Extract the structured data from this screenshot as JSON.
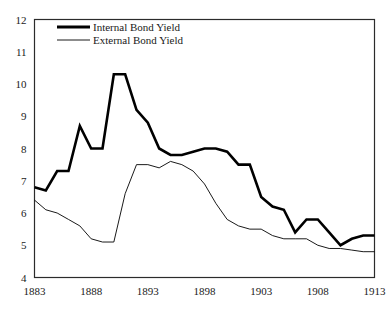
{
  "chart_data": {
    "type": "line",
    "title": "",
    "xlabel": "",
    "ylabel": "",
    "xlim": [
      1883,
      1913
    ],
    "ylim": [
      4,
      12
    ],
    "grid": false,
    "legend_position": "top-left-inside",
    "x_ticks": [
      1883,
      1888,
      1893,
      1898,
      1903,
      1908,
      1913
    ],
    "x_tick_labels": [
      "1883",
      "1888",
      "1893",
      "1898",
      "1903",
      "1908",
      "1913"
    ],
    "y_ticks": [
      4,
      5,
      6,
      7,
      8,
      9,
      10,
      11,
      12
    ],
    "y_tick_labels": [
      "4",
      "5",
      "6",
      "7",
      "8",
      "9",
      "10",
      "11",
      "12"
    ],
    "x": [
      1883,
      1884,
      1885,
      1886,
      1887,
      1888,
      1889,
      1890,
      1891,
      1892,
      1893,
      1894,
      1895,
      1896,
      1897,
      1898,
      1899,
      1900,
      1901,
      1902,
      1903,
      1904,
      1905,
      1906,
      1907,
      1908,
      1909,
      1910,
      1911,
      1912,
      1913
    ],
    "series": [
      {
        "name": "Internal Bond Yield",
        "color": "#000000",
        "line_width": 2.6,
        "values": [
          6.8,
          6.7,
          7.3,
          7.3,
          8.7,
          8.0,
          8.0,
          10.3,
          10.3,
          9.2,
          8.8,
          8.0,
          7.8,
          7.8,
          7.9,
          8.0,
          8.0,
          7.9,
          7.5,
          7.5,
          6.5,
          6.2,
          6.1,
          5.4,
          5.8,
          5.8,
          5.4,
          5.0,
          5.2,
          5.3,
          5.3
        ]
      },
      {
        "name": "External Bond Yield",
        "color": "#000000",
        "line_width": 0.9,
        "values": [
          6.4,
          6.1,
          6.0,
          5.8,
          5.6,
          5.2,
          5.1,
          5.1,
          6.6,
          7.5,
          7.5,
          7.4,
          7.6,
          7.5,
          7.3,
          6.9,
          6.3,
          5.8,
          5.6,
          5.5,
          5.5,
          5.3,
          5.2,
          5.2,
          5.2,
          5.0,
          4.9,
          4.9,
          4.85,
          4.8,
          4.8
        ]
      }
    ]
  },
  "legend": {
    "items": [
      {
        "label": "Internal Bond Yield",
        "style": "thick"
      },
      {
        "label": "External Bond Yield",
        "style": "thin"
      }
    ]
  },
  "colors": {
    "ink": "#1a1a1a",
    "frame": "#2b2b2b",
    "background": "#ffffff"
  }
}
